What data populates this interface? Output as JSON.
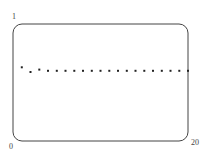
{
  "chart_data": {
    "type": "scatter",
    "title": "",
    "xlabel": "",
    "ylabel": "",
    "xlim": [
      0,
      20
    ],
    "ylim": [
      0,
      1
    ],
    "grid": false,
    "legend": null,
    "tick_labels": {
      "y_top": "1",
      "x_left": "0",
      "x_right": "20"
    },
    "x": [
      1,
      2,
      3,
      4,
      5,
      6,
      7,
      8,
      9,
      10,
      11,
      12,
      13,
      14,
      15,
      16,
      17,
      18,
      19,
      20
    ],
    "y": [
      0.63,
      0.59,
      0.61,
      0.6,
      0.6,
      0.6,
      0.6,
      0.6,
      0.6,
      0.6,
      0.6,
      0.6,
      0.6,
      0.6,
      0.6,
      0.6,
      0.6,
      0.6,
      0.6,
      0.6
    ],
    "marker_color": "#222222",
    "frame_color": "#444444"
  }
}
